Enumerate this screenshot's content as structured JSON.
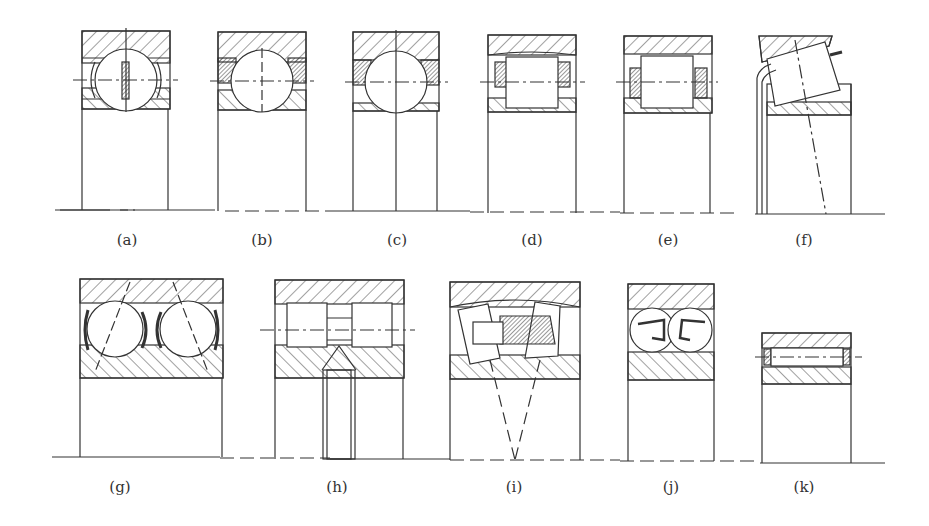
{
  "figure": {
    "stroke_color": "#333333",
    "hatch_color": "#444444",
    "background": "#ffffff"
  },
  "panels": [
    {
      "id": "a",
      "label": "(a)",
      "type": "deep-groove ball bearing with riveted cage"
    },
    {
      "id": "b",
      "label": "(b)",
      "type": "ball bearing with solid cage"
    },
    {
      "id": "c",
      "label": "(c)",
      "type": "ball bearing with solid cage"
    },
    {
      "id": "d",
      "label": "(d)",
      "type": "cylindrical roller bearing"
    },
    {
      "id": "e",
      "label": "(e)",
      "type": "cylindrical roller bearing"
    },
    {
      "id": "f",
      "label": "(f)",
      "type": "tapered roller bearing"
    },
    {
      "id": "g",
      "label": "(g)",
      "type": "double-row angular contact ball bearing"
    },
    {
      "id": "h",
      "label": "(h)",
      "type": "double-row cylindrical roller bearing"
    },
    {
      "id": "i",
      "label": "(i)",
      "type": "spherical roller bearing"
    },
    {
      "id": "j",
      "label": "(j)",
      "type": "self-aligning ball bearing"
    },
    {
      "id": "k",
      "label": "(k)",
      "type": "needle roller bearing"
    }
  ]
}
